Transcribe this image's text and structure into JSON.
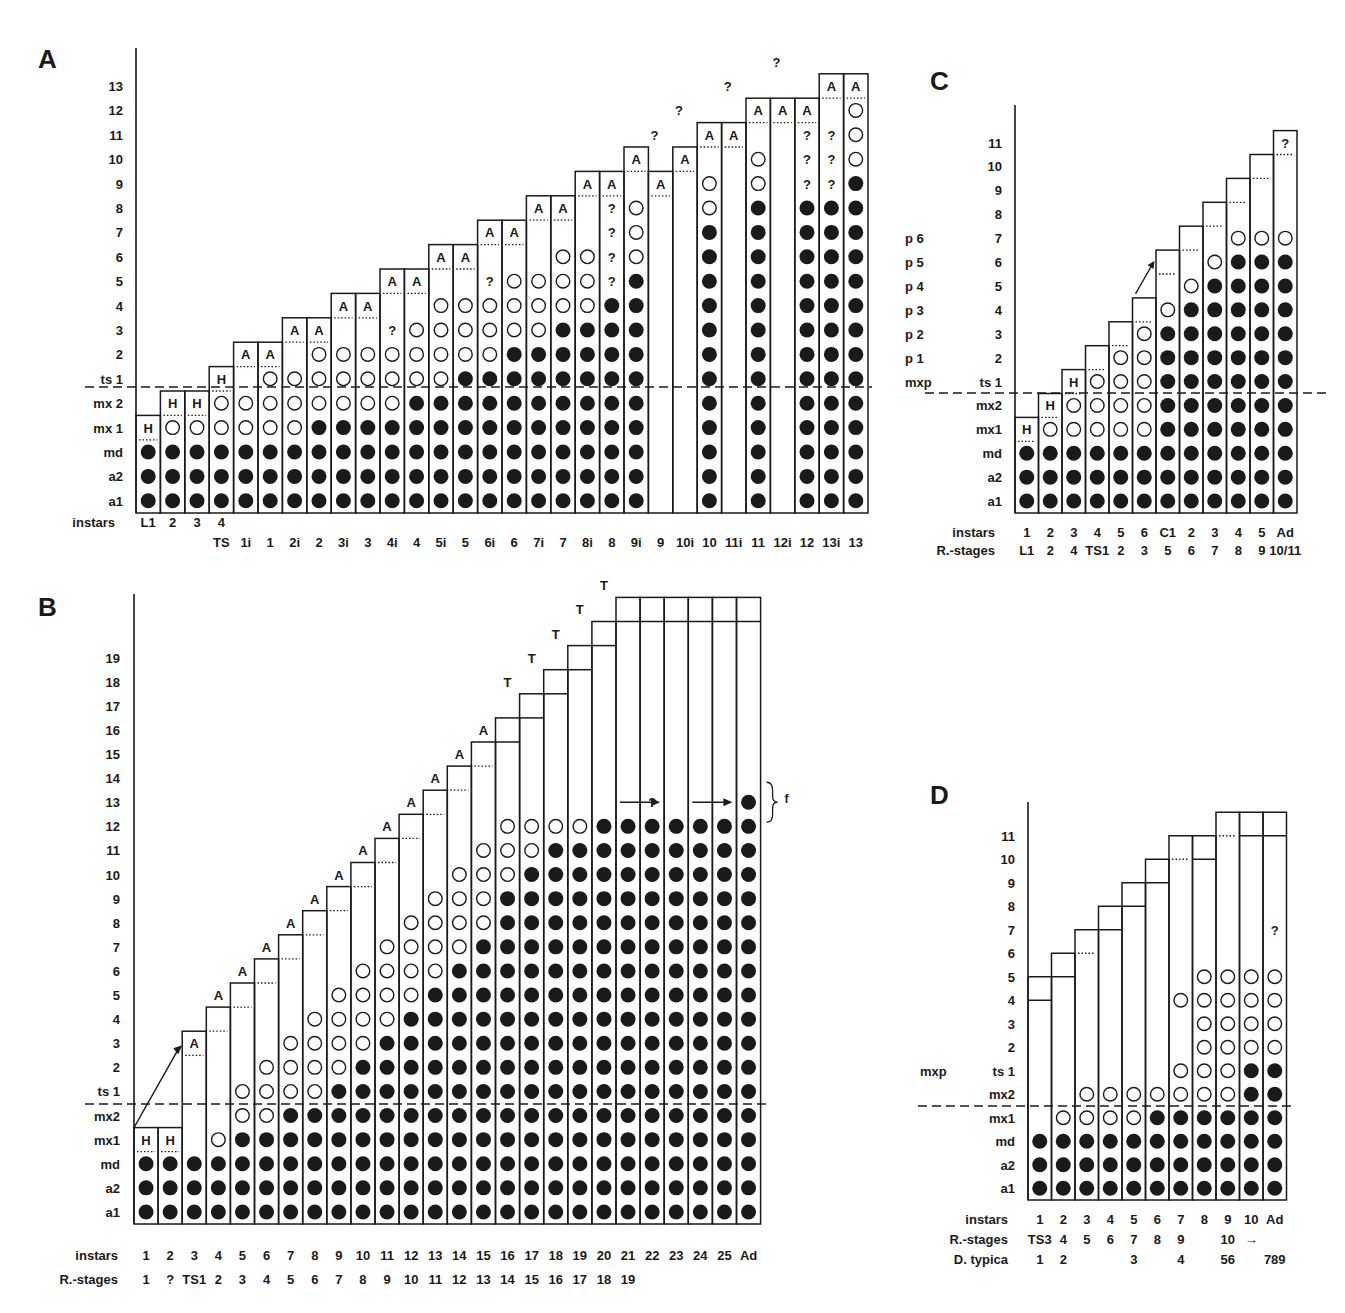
{
  "figure": {
    "legend": {
      "filled": "filled circle = appendage present/developed",
      "open": "open circle = appendage rudiment"
    },
    "colors": {
      "ink": "#1a1a1a",
      "paper": "#ffffff"
    }
  },
  "panels": {
    "A": {
      "letter": "A",
      "row_labels": [
        "a1",
        "a2",
        "md",
        "mx 1",
        "mx 2",
        "ts 1",
        "2",
        "3",
        "4",
        "5",
        "6",
        "7",
        "8",
        "9",
        "10",
        "11",
        "12",
        "13"
      ],
      "x_axis_rows": [
        {
          "label": "instars",
          "values": [
            "L1",
            "2",
            "3",
            "4",
            "",
            "",
            "",
            "",
            "",
            "",
            "",
            "",
            "",
            "",
            "",
            "",
            "",
            "",
            "",
            "",
            "",
            "",
            "",
            "",
            "",
            "",
            "",
            "",
            "",
            "",
            ""
          ]
        },
        {
          "label": "",
          "values": [
            "",
            "",
            "",
            "TS",
            "1i",
            "1",
            "2i",
            "2",
            "3i",
            "3",
            "4i",
            "4",
            "5i",
            "5",
            "6i",
            "6",
            "7i",
            "7",
            "8i",
            "8",
            "9i",
            "9",
            "10i",
            "10",
            "11i",
            "11",
            "12i",
            "12",
            "13i",
            "13"
          ]
        }
      ],
      "columns": [
        {
          "cells": "FFFH",
          "top": 4,
          "dot": 3
        },
        {
          "cells": "FFFOH",
          "top": 5,
          "dot": 4
        },
        {
          "cells": "FFFOH",
          "top": 5,
          "dot": 4
        },
        {
          "cells": "FFFOOH",
          "top": 6,
          "dot": 5
        },
        {
          "cells": "FFFOO_A",
          "top": 7,
          "dot": 6
        },
        {
          "cells": "FFFOOOA",
          "top": 7,
          "dot": 6
        },
        {
          "cells": "FFFOOO_A",
          "top": 8,
          "dot": 7
        },
        {
          "cells": "FFFFOOOA",
          "top": 8,
          "dot": 7
        },
        {
          "cells": "FFFFOOO_A",
          "top": 9,
          "dot": 8
        },
        {
          "cells": "FFFFOOO_A",
          "top": 9,
          "dot": 8
        },
        {
          "cells": "FFFFOOO?_A",
          "top": 10,
          "dot": 9
        },
        {
          "cells": "FFFFFOOO_A",
          "top": 10,
          "dot": 9
        },
        {
          "cells": "FFFFFOOOO_A",
          "top": 11,
          "dot": 10
        },
        {
          "cells": "FFFFFFOOO_A",
          "top": 11,
          "dot": 10
        },
        {
          "cells": "FFFFFFOOO?_A",
          "top": 12,
          "dot": 11
        },
        {
          "cells": "FFFFFFFOOO_A",
          "top": 12,
          "dot": 11
        },
        {
          "cells": "FFFFFFFOOO__A",
          "top": 13,
          "dot": 12
        },
        {
          "cells": "FFFFFFFFOOO_A",
          "top": 13,
          "dot": 12
        },
        {
          "cells": "FFFFFFFFOOO__A",
          "top": 14,
          "dot": 13
        },
        {
          "cells": "FFFFFFFFF????A",
          "top": 14,
          "dot": 13
        },
        {
          "cells": "FFFFFFFFFFOOO_A",
          "top": 15,
          "dot": 14
        },
        {
          "cells": "______________A?",
          "top": 15,
          "dot": 14
        },
        {
          "cells": "_______________A?",
          "top": 16,
          "dot": 15
        },
        {
          "cells": "FFFFFFFFFFFFOO_A",
          "top": 16,
          "dot": 15
        },
        {
          "cells": "________________A?",
          "top": 17,
          "dot": 16
        },
        {
          "cells": "FFFFFFFFFFFFOO_O_A",
          "top": 17,
          "dot": 16,
          "fix": "11"
        },
        {
          "cells": "_________________A?",
          "top": 18,
          "dot": 17
        },
        {
          "cells": "FFFFFFFFFFFFF???_A",
          "top": 18,
          "dot": 17
        },
        {
          "cells": "FFFFFFFFFFFFF???__A",
          "top": 19,
          "dot": 18
        },
        {
          "cells": "FFFFFFFFFFFFFFOOO_A",
          "top": 19,
          "dot": 18
        }
      ]
    },
    "B": {
      "letter": "B",
      "row_labels": [
        "a1",
        "a2",
        "md",
        "mx1",
        "mx2",
        "ts 1",
        "2",
        "3",
        "4",
        "5",
        "6",
        "7",
        "8",
        "9",
        "10",
        "11",
        "12",
        "13",
        "14",
        "15",
        "16",
        "17",
        "18",
        "19"
      ],
      "x_axis_rows": [
        {
          "label": "instars",
          "values": [
            "1",
            "2",
            "3",
            "4",
            "5",
            "6",
            "7",
            "8",
            "9",
            "10",
            "11",
            "12",
            "13",
            "14",
            "15",
            "16",
            "17",
            "18",
            "19",
            "20",
            "21",
            "22",
            "23",
            "24",
            "25",
            "Ad"
          ]
        },
        {
          "label": "R.-stages",
          "values": [
            "1",
            "?",
            "TS1",
            "2",
            "3",
            "4",
            "5",
            "6",
            "7",
            "8",
            "9",
            "10",
            "11",
            "12",
            "13",
            "14",
            "15",
            "16",
            "17",
            "18",
            "19",
            "",
            "",
            "",
            "",
            ""
          ]
        }
      ],
      "columns": [
        {
          "cells": "FFFH",
          "top": 4,
          "dot": 3
        },
        {
          "cells": "FFFH",
          "top": 4,
          "dot": 3
        },
        {
          "cells": "FFF____A",
          "top": 8,
          "dot": 7
        },
        {
          "cells": "FFFO_____A",
          "top": 9,
          "dot": 8
        },
        {
          "cells": "FFFFOO____A",
          "top": 10,
          "dot": 9
        },
        {
          "cells": "FFFFOOO____A",
          "top": 11,
          "dot": 10
        },
        {
          "cells": "FFFFFOOO____A",
          "top": 12,
          "dot": 11
        },
        {
          "cells": "FFFFFOOOO____A",
          "top": 13,
          "dot": 12
        },
        {
          "cells": "FFFFFFOOOO____A",
          "top": 14,
          "dot": 13
        },
        {
          "cells": "FFFFFFFOOOO____A",
          "top": 15,
          "dot": 14
        },
        {
          "cells": "FFFFFFFFOOOO____A",
          "top": 16,
          "dot": 15
        },
        {
          "cells": "FFFFFFFFFOOOO____A",
          "top": 17,
          "dot": 16
        },
        {
          "cells": "FFFFFFFFFFOOOO____A",
          "top": 18,
          "dot": 17
        },
        {
          "cells": "FFFFFFFFFFFOOOO____A",
          "top": 19,
          "dot": 18
        },
        {
          "cells": "FFFFFFFFFFFFOOOO____A",
          "top": 20,
          "dot": 19
        },
        {
          "cells": "FFFFFFFFFFFFFFOOO_____T",
          "top": 21,
          "dot": -1
        },
        {
          "cells": "FFFFFFFFFFFFFFFOO______T",
          "top": 22,
          "dot": -1
        },
        {
          "cells": "FFFFFFFFFFFFFFFFO_______T",
          "top": 23,
          "dot": -1
        },
        {
          "cells": "FFFFFFFFFFFFFFFFO________T",
          "top": 24,
          "dot": -1
        },
        {
          "cells": "FFFFFFFFFFFFFFFFF_________T",
          "top": 25,
          "dot": -1
        },
        {
          "cells": "FFFFFFFFFFFFFFFFF__________T",
          "top": 26,
          "dot": -1
        },
        {
          "cells": "FFFFFFFFFFFFFFFFF?_________T",
          "top": 26,
          "dot": -1
        },
        {
          "cells": "FFFFFFFFFFFFFFFFF__________T",
          "top": 26,
          "dot": -1
        },
        {
          "cells": "FFFFFFFFFFFFFFFFF__________T",
          "top": 26,
          "dot": -1
        },
        {
          "cells": "FFFFFFFFFFFFFFFFF__________T",
          "top": 26,
          "dot": -1
        },
        {
          "cells": "FFFFFFFFFFFFFFFFFF_________T",
          "top": 26,
          "dot": -1
        }
      ],
      "annotations": {
        "bracket_label": "f",
        "question": "?"
      }
    },
    "C": {
      "letter": "C",
      "row_labels": [
        "a1",
        "a2",
        "md",
        "mx1",
        "mx2",
        "ts 1",
        "2",
        "3",
        "4",
        "5",
        "6",
        "7",
        "8",
        "9",
        "10",
        "11"
      ],
      "left_labels": [
        "mxp",
        "p 1",
        "p 2",
        "p 3",
        "p 4",
        "p 5",
        "p 6"
      ],
      "x_axis_rows": [
        {
          "label": "instars",
          "values": [
            "1",
            "2",
            "3",
            "4",
            "5",
            "6",
            "C1",
            "2",
            "3",
            "4",
            "5",
            "Ad"
          ]
        },
        {
          "label": "R.-stages",
          "values": [
            "L1",
            "2",
            "4",
            "TS1",
            "2",
            "3",
            "5",
            "6",
            "7",
            "8",
            "9",
            "10/11"
          ]
        }
      ],
      "columns": [
        {
          "cells": "FFFH",
          "top": 4,
          "dot": 3
        },
        {
          "cells": "FFFOH",
          "top": 5,
          "dot": 4
        },
        {
          "cells": "FFFOOH",
          "top": 6,
          "dot": 5
        },
        {
          "cells": "FFFOOO",
          "top": 7,
          "dot": 6
        },
        {
          "cells": "FFFOOOO",
          "top": 8,
          "dot": 7
        },
        {
          "cells": "FFFOOOOO",
          "top": 9,
          "dot": 8
        },
        {
          "cells": "FFFFFFFFO",
          "top": 11,
          "dot": 10
        },
        {
          "cells": "FFFFFFFFFO",
          "top": 12,
          "dot": 11
        },
        {
          "cells": "FFFFFFFFFFO",
          "top": 13,
          "dot": 12
        },
        {
          "cells": "FFFFFFFFFFFO",
          "top": 14,
          "dot": 13
        },
        {
          "cells": "FFFFFFFFFFFO",
          "top": 15,
          "dot": 14
        },
        {
          "cells": "FFFFFFFFFFFO___?",
          "top": 16,
          "dot": 15
        }
      ]
    },
    "D": {
      "letter": "D",
      "row_labels": [
        "a1",
        "a2",
        "md",
        "mx1",
        "mx2",
        "ts 1",
        "2",
        "3",
        "4",
        "5",
        "6",
        "7",
        "8",
        "9",
        "10",
        "11"
      ],
      "left_labels": [
        "mxp"
      ],
      "x_axis_rows": [
        {
          "label": "instars",
          "values": [
            "1",
            "2",
            "3",
            "4",
            "5",
            "6",
            "7",
            "8",
            "9",
            "10",
            "Ad"
          ]
        },
        {
          "label": "R.-stages",
          "values": [
            "TS3",
            "4",
            "5",
            "6",
            "7",
            "8",
            "9",
            "",
            "10",
            "→",
            ""
          ]
        },
        {
          "label": "D. typica",
          "values": [
            "1",
            "2",
            "",
            "",
            "3",
            "",
            "4",
            "",
            "56",
            "",
            "789"
          ]
        }
      ],
      "columns": [
        {
          "cells": "FFF",
          "top": 9.5,
          "inner": 8.5
        },
        {
          "cells": "FFFO",
          "top": 10.5,
          "inner": 9.5
        },
        {
          "cells": "FFFOO",
          "top": 11.5,
          "dot": 10.5
        },
        {
          "cells": "FFFOO",
          "top": 12.5,
          "inner": 11.5
        },
        {
          "cells": "FFFOO",
          "top": 13.5,
          "inner": 12.5
        },
        {
          "cells": "FFFFO",
          "top": 14.5,
          "inner": 13.5
        },
        {
          "cells": "FFFFOO__O",
          "top": 15.5,
          "dot": 14.5
        },
        {
          "cells": "FFFFOOOOOO",
          "top": 15.5,
          "inner": 14.5
        },
        {
          "cells": "FFFFOOOOOO",
          "top": 16.5,
          "dot": 15.5
        },
        {
          "cells": "FFFFFFOOOO",
          "top": 16.5,
          "inner": 15.5
        },
        {
          "cells": "FFFFFFOOOO_?",
          "top": 16.5,
          "inner": 15.5
        }
      ]
    }
  }
}
